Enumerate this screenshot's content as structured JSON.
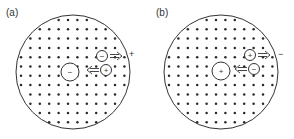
{
  "panels": [
    {
      "id": "a",
      "label": "(a)",
      "label_pos": [
        6,
        16
      ],
      "circle": {
        "cx": 73,
        "cy": 72,
        "r": 57
      },
      "grid": {
        "x0": 21,
        "y0": 20,
        "dx": 9.4,
        "dy": 9.3,
        "cols": 12,
        "rows": 12
      },
      "central_charge": {
        "sign": "−",
        "cx": 70,
        "cy": 72,
        "r": 9
      },
      "carrier_top": {
        "sign": "−",
        "cx": 102,
        "cy": 56,
        "r": 5.5,
        "arrow": "right",
        "arrow_x": 110,
        "arrow_y": 56
      },
      "carrier_bottom": {
        "sign": "+",
        "cx": 106,
        "cy": 70,
        "r": 5.5,
        "arrow": "left",
        "arrow_x": 87,
        "arrow_y": 70
      },
      "outside_sign": {
        "text": "+",
        "x": 129,
        "y": 57
      }
    },
    {
      "id": "b",
      "label": "(b)",
      "label_pos": [
        156,
        16
      ],
      "circle": {
        "cx": 221,
        "cy": 72,
        "r": 57
      },
      "grid": {
        "x0": 169,
        "y0": 20,
        "dx": 9.4,
        "dy": 9.3,
        "cols": 12,
        "rows": 12
      },
      "central_charge": {
        "sign": "+",
        "cx": 221,
        "cy": 71,
        "r": 9
      },
      "carrier_top": {
        "sign": "+",
        "cx": 250,
        "cy": 55,
        "r": 5.5,
        "arrow": "right",
        "arrow_x": 258,
        "arrow_y": 55
      },
      "carrier_bottom": {
        "sign": "−",
        "cx": 254,
        "cy": 69,
        "r": 5.5,
        "arrow": "left",
        "arrow_x": 235,
        "arrow_y": 69
      },
      "outside_sign": {
        "text": "−",
        "x": 278,
        "y": 57
      }
    }
  ],
  "colors": {
    "stroke": "#333333",
    "dot": "#2a2a2a",
    "background": "#ffffff"
  }
}
